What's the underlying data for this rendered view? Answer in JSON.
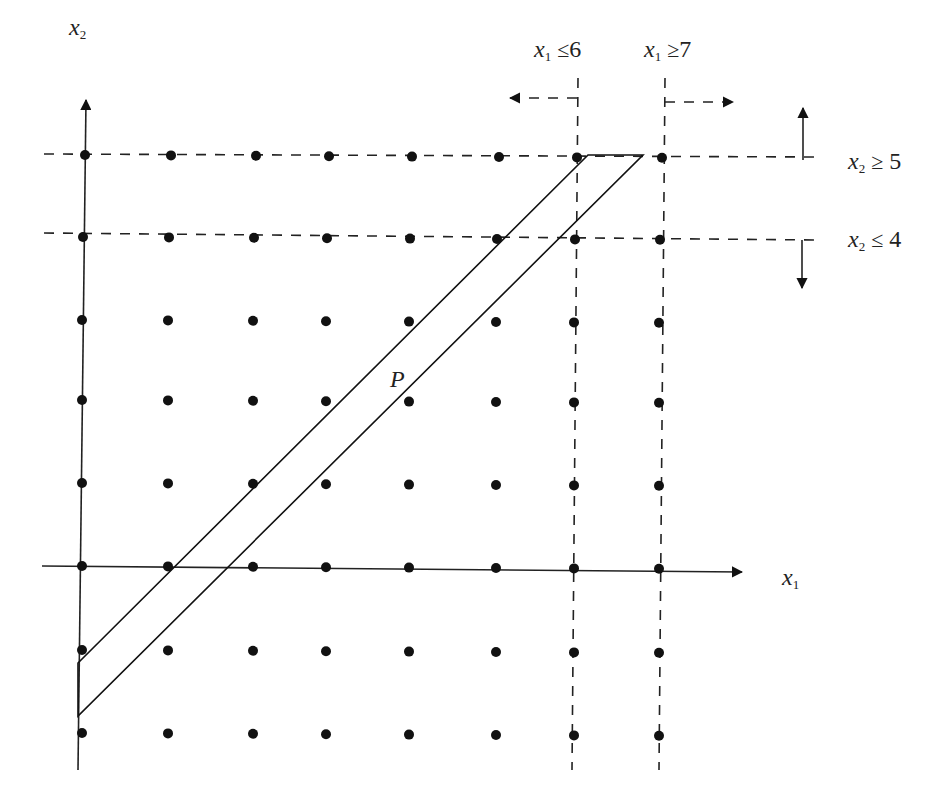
{
  "diagram": {
    "type": "integer-lattice-branching",
    "axes": {
      "x_label": "x",
      "x_sub": "1",
      "y_label": "x",
      "y_sub": "2"
    },
    "region_label": "P",
    "constraints": [
      {
        "var": "x",
        "sub": "1",
        "op": "≤",
        "value": "6",
        "direction": "left"
      },
      {
        "var": "x",
        "sub": "1",
        "op": "≥",
        "value": "7",
        "direction": "right"
      },
      {
        "var": "x",
        "sub": "2",
        "op": "≥",
        "value": "5",
        "direction": "up"
      },
      {
        "var": "x",
        "sub": "2",
        "op": "≤",
        "value": "4",
        "direction": "down"
      }
    ],
    "lattice": {
      "columns": 8,
      "rows": 8,
      "row_y": [
        155,
        237,
        320,
        400,
        483,
        566,
        650,
        733
      ],
      "col_x": [
        82,
        168,
        253,
        326,
        409,
        496,
        574,
        659
      ]
    },
    "polygon": [
      [
        78,
        663
      ],
      [
        588,
        155
      ],
      [
        643,
        155
      ],
      [
        78,
        716
      ]
    ],
    "colors": {
      "ink": "#111111",
      "background": "#ffffff"
    }
  }
}
